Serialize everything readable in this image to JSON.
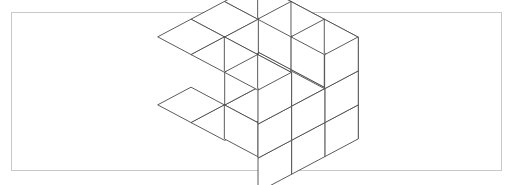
{
  "page": {
    "width": 513,
    "height": 185,
    "background_color": "#ffffff"
  },
  "frame": {
    "name": "figure-border",
    "x": 11,
    "y": 12,
    "width": 491,
    "height": 159,
    "border_color": "#c9c9c9",
    "border_width": 1,
    "fill_color": "#ffffff"
  },
  "figure": {
    "type": "isometric-voxel-drawing",
    "line_color": "#4a4a4a",
    "face_color": "#ffffff",
    "line_width": 0.9,
    "projection": {
      "cube_size": 34,
      "x_axis": [
        0.98,
        0.52
      ],
      "y_axis": [
        -0.98,
        0.52
      ],
      "z_axis": [
        0,
        -1
      ],
      "origin_x": 258,
      "origin_y": 86
    },
    "grid_dimensions": {
      "nx": 3,
      "ny": 3,
      "nz": 3
    },
    "cube_count": 21,
    "voxels": [
      [
        0,
        0,
        0
      ],
      [
        1,
        0,
        0
      ],
      [
        2,
        0,
        0
      ],
      [
        0,
        1,
        0
      ],
      [
        2,
        1,
        0
      ],
      [
        0,
        2,
        0
      ],
      [
        1,
        2,
        0
      ],
      [
        2,
        2,
        0
      ],
      [
        0,
        0,
        1
      ],
      [
        1,
        0,
        1
      ],
      [
        2,
        0,
        1
      ],
      [
        0,
        1,
        1
      ],
      [
        2,
        1,
        1
      ],
      [
        2,
        2,
        1
      ],
      [
        0,
        0,
        2
      ],
      [
        1,
        0,
        2
      ],
      [
        0,
        1,
        2
      ],
      [
        0,
        2,
        2
      ],
      [
        1,
        2,
        2
      ],
      [
        2,
        2,
        2
      ],
      [
        2,
        0,
        2
      ]
    ]
  }
}
